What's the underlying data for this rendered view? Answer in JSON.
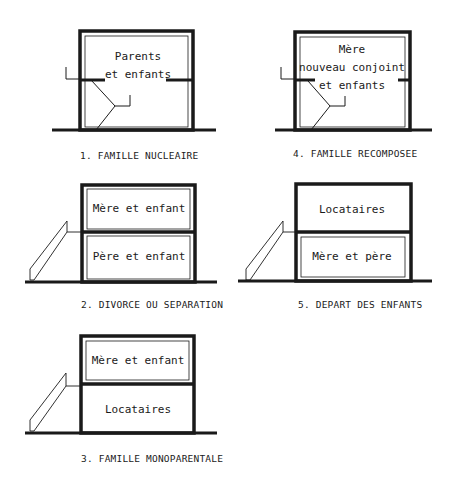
{
  "diagrams": [
    {
      "id": 1,
      "caption": "1. FAMILLE NUCLEAIRE",
      "rooms": [
        {
          "lines": [
            "Parents",
            "et enfants"
          ]
        }
      ],
      "has_internal_stair": true,
      "has_external_stair": false
    },
    {
      "id": 2,
      "caption": "2. DIVORCE OU SEPARATION",
      "rooms": [
        {
          "position": "upper",
          "lines": [
            "Mère et enfant"
          ]
        },
        {
          "position": "lower",
          "lines": [
            "Père et enfant"
          ]
        }
      ],
      "has_internal_stair": false,
      "has_external_stair": true
    },
    {
      "id": 3,
      "caption": "3. FAMILLE MONOPARENTALE",
      "rooms": [
        {
          "position": "upper",
          "lines": [
            "Mère et enfant"
          ]
        },
        {
          "position": "lower",
          "lines": [
            "Locataires"
          ]
        }
      ],
      "has_internal_stair": false,
      "has_external_stair": true
    },
    {
      "id": 4,
      "caption": "4. FAMILLE RECOMPOSEE",
      "rooms": [
        {
          "lines": [
            "Mère",
            "nouveau conjoint",
            "et enfants"
          ]
        }
      ],
      "has_internal_stair": true,
      "has_external_stair": false
    },
    {
      "id": 5,
      "caption": "5. DEPART DES ENFANTS",
      "rooms": [
        {
          "position": "upper",
          "lines": [
            "Locataires"
          ]
        },
        {
          "position": "lower",
          "lines": [
            "Mère et père"
          ]
        }
      ],
      "has_internal_stair": false,
      "has_external_stair": true
    }
  ],
  "colors": {
    "ink": "#1a1a1a",
    "background": "#ffffff"
  }
}
